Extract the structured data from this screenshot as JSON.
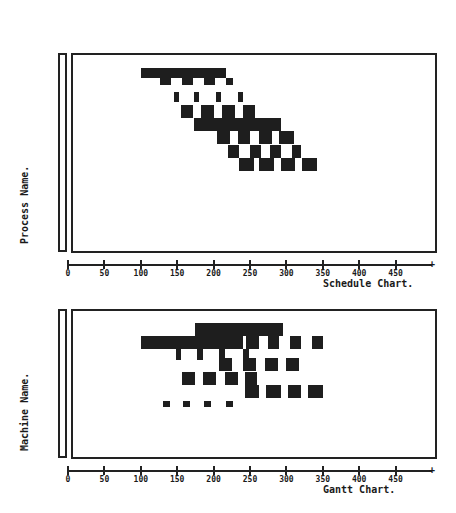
{
  "chart_data": [
    {
      "type": "gantt",
      "title": "Schedule Chart.",
      "ylabel": "Process Name.",
      "xlabel": "",
      "xlim": [
        0,
        500
      ],
      "x_ticks": [
        "0",
        "50",
        "100",
        "150",
        "200",
        "250",
        "300",
        "350",
        "400",
        "450"
      ],
      "grid": false,
      "rows": [
        {
          "y": 68,
          "h": 10,
          "segments": [
            [
              100,
              190
            ],
            [
              190,
              217
            ]
          ]
        },
        {
          "y": 78,
          "h": 7,
          "segments": [
            [
              127,
              142
            ],
            [
              157,
              172
            ],
            [
              187,
              202
            ],
            [
              217,
              227
            ]
          ]
        },
        {
          "y": 92,
          "h": 10,
          "segments": [
            [
              145,
              152
            ],
            [
              173,
              180
            ],
            [
              203,
              210
            ],
            [
              233,
              240
            ]
          ]
        },
        {
          "y": 105,
          "h": 13,
          "segments": [
            [
              155,
              172
            ],
            [
              183,
              200
            ],
            [
              212,
              230
            ],
            [
              240,
              257
            ]
          ]
        },
        {
          "y": 118,
          "h": 13,
          "segments": [
            [
              173,
              292
            ]
          ]
        },
        {
          "y": 131,
          "h": 13,
          "segments": [
            [
              205,
              222
            ],
            [
              233,
              250
            ],
            [
              262,
              280
            ],
            [
              290,
              310
            ]
          ]
        },
        {
          "y": 145,
          "h": 13,
          "segments": [
            [
              220,
              235
            ],
            [
              250,
              265
            ],
            [
              278,
              293
            ],
            [
              308,
              320
            ]
          ]
        },
        {
          "y": 158,
          "h": 13,
          "segments": [
            [
              235,
              255
            ],
            [
              263,
              283
            ],
            [
              293,
              312
            ],
            [
              322,
              342
            ]
          ]
        }
      ]
    },
    {
      "type": "gantt",
      "title": "Gantt Chart.",
      "ylabel": "Machine Name.",
      "xlabel": "",
      "xlim": [
        0,
        500
      ],
      "x_ticks": [
        "0",
        "50",
        "100",
        "150",
        "200",
        "250",
        "300",
        "350",
        "400",
        "450"
      ],
      "grid": false,
      "rows": [
        {
          "y": 323,
          "h": 13,
          "segments": [
            [
              175,
              295
            ]
          ]
        },
        {
          "y": 336,
          "h": 13,
          "segments": [
            [
              100,
              240
            ],
            [
              245,
              262
            ],
            [
              275,
              290
            ],
            [
              305,
              320
            ],
            [
              335,
              350
            ]
          ]
        },
        {
          "y": 349,
          "h": 11,
          "segments": [
            [
              148,
              155
            ],
            [
              177,
              185
            ],
            [
              207,
              215
            ],
            [
              240,
              248
            ]
          ]
        },
        {
          "y": 358,
          "h": 13,
          "segments": [
            [
              207,
              225
            ],
            [
              240,
              258
            ],
            [
              270,
              288
            ],
            [
              300,
              318
            ]
          ]
        },
        {
          "y": 372,
          "h": 13,
          "segments": [
            [
              157,
              175
            ],
            [
              185,
              203
            ],
            [
              215,
              233
            ],
            [
              243,
              260
            ]
          ]
        },
        {
          "y": 385,
          "h": 13,
          "segments": [
            [
              243,
              262
            ],
            [
              272,
              292
            ],
            [
              302,
              320
            ],
            [
              330,
              350
            ]
          ]
        },
        {
          "y": 401,
          "h": 6,
          "segments": [
            [
              130,
              140
            ],
            [
              158,
              168
            ],
            [
              187,
              197
            ],
            [
              217,
              227
            ]
          ]
        }
      ]
    }
  ],
  "panels": {
    "schedule": {
      "caption": "Schedule Chart.",
      "ylabel": "Process Name."
    },
    "gantt": {
      "caption": "Gantt Chart.",
      "ylabel": "Machine Name."
    }
  },
  "axis_ticks": [
    "0",
    "50",
    "100",
    "150",
    "200",
    "250",
    "300",
    "350",
    "400",
    "450"
  ],
  "colors": {
    "bar": "#1e1e1e",
    "frame": "#222222",
    "background": "#ffffff"
  }
}
